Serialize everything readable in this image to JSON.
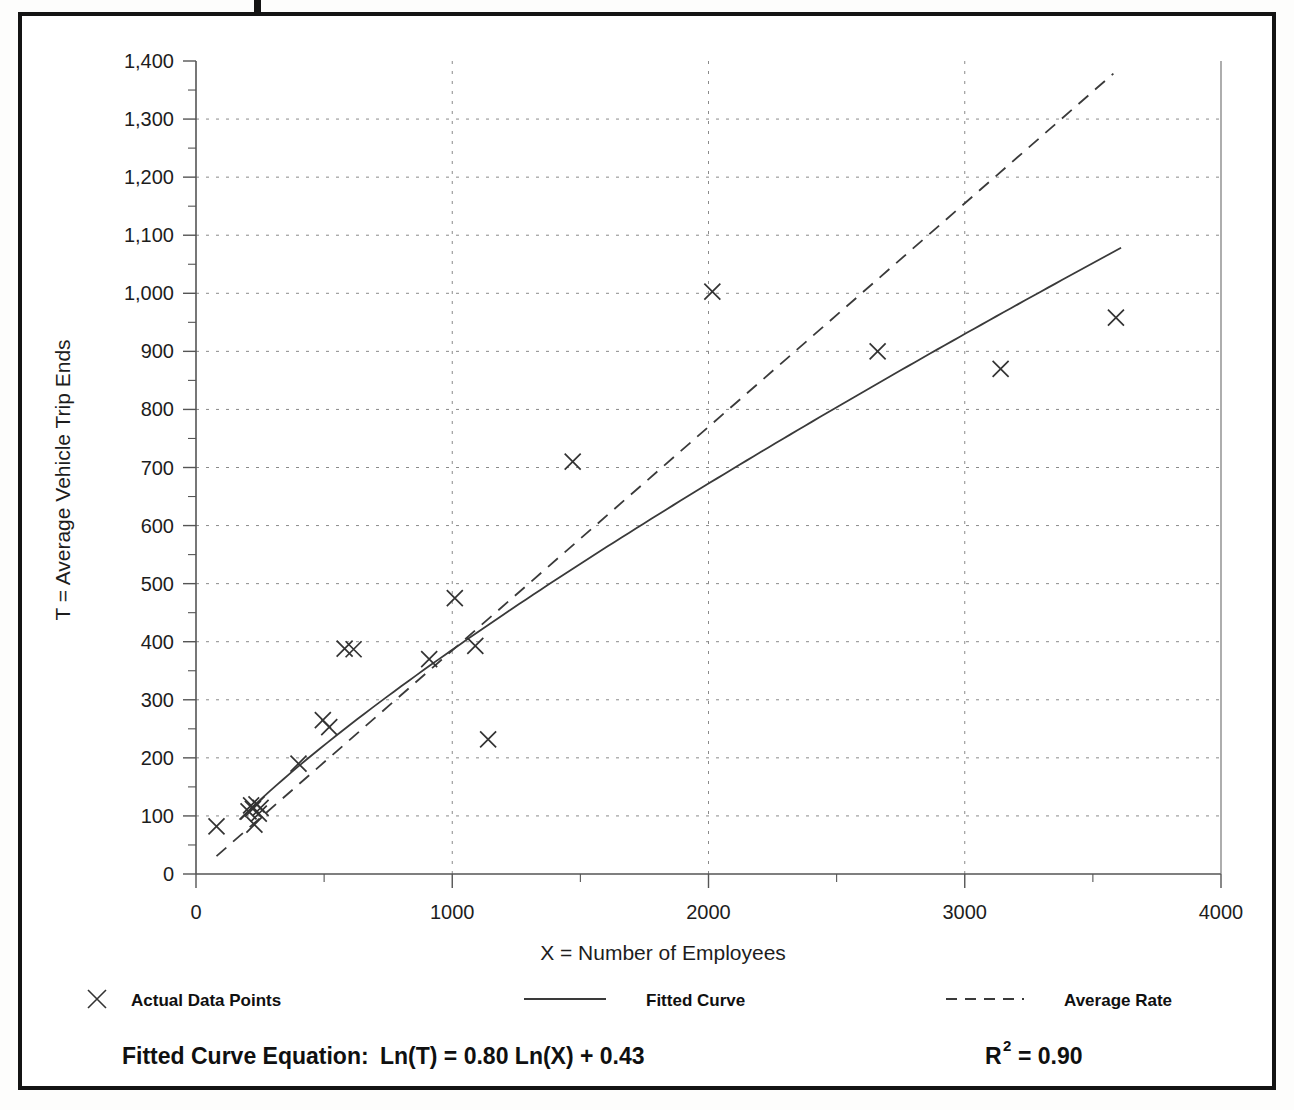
{
  "figure": {
    "frame_color": "#141414",
    "background": "#ffffff"
  },
  "chart_data": {
    "type": "scatter",
    "title": "",
    "xlabel": "X = Number of Employees",
    "ylabel": "T = Average Vehicle Trip Ends",
    "xlim": [
      0,
      4000
    ],
    "ylim": [
      0,
      1400
    ],
    "x_ticks": [
      0,
      1000,
      2000,
      3000,
      4000
    ],
    "x_tick_labels": [
      "0",
      "1000",
      "2000",
      "3000",
      "4000"
    ],
    "x_minor_step": 500,
    "y_ticks": [
      0,
      100,
      200,
      300,
      400,
      500,
      600,
      700,
      800,
      900,
      1000,
      1100,
      1200,
      1300,
      1400
    ],
    "y_tick_labels": [
      "0",
      "100",
      "200",
      "300",
      "400",
      "500",
      "600",
      "700",
      "800",
      "900",
      "1,000",
      "1,100",
      "1,200",
      "1,300",
      "1,400"
    ],
    "y_minor_step": 50,
    "grid": true,
    "grid_style": "dotted",
    "grid_color": "#8a8a8a",
    "legend_position": "below",
    "series": [
      {
        "name": "Actual Data Points",
        "type": "scatter",
        "marker": "x",
        "color": "#333333",
        "points": [
          [
            80,
            82
          ],
          [
            205,
            108
          ],
          [
            215,
            118
          ],
          [
            222,
            112
          ],
          [
            228,
            85
          ],
          [
            236,
            120
          ],
          [
            245,
            104
          ],
          [
            252,
            114
          ],
          [
            400,
            190
          ],
          [
            495,
            265
          ],
          [
            520,
            253
          ],
          [
            580,
            388
          ],
          [
            615,
            387
          ],
          [
            910,
            370
          ],
          [
            1010,
            475
          ],
          [
            1090,
            393
          ],
          [
            1140,
            232
          ],
          [
            1470,
            710
          ],
          [
            2015,
            1003
          ],
          [
            2660,
            900
          ],
          [
            3140,
            870
          ],
          [
            3590,
            958
          ]
        ]
      },
      {
        "name": "Fitted Curve",
        "type": "line",
        "style": "solid",
        "color": "#3a3a3a",
        "equation": "Ln(T) = 0.80 Ln(X) + 0.43",
        "intercept": 0.43,
        "slope": 0.8,
        "x_range": [
          170,
          3610
        ]
      },
      {
        "name": "Average Rate",
        "type": "line",
        "style": "dashed",
        "color": "#3a3a3a",
        "slope_per_employee": 0.385,
        "x_range": [
          80,
          3580
        ]
      }
    ]
  },
  "legend": {
    "items": [
      {
        "label": "Actual Data Points",
        "marker": "x-marker"
      },
      {
        "label": "Fitted Curve",
        "marker": "solid-line"
      },
      {
        "label": "Average Rate",
        "marker": "dashed-line"
      }
    ]
  },
  "footnote": {
    "equation_label": "Fitted Curve Equation:",
    "equation_body": "Ln(T) = 0.80 Ln(X) + 0.43",
    "r_squared_base": "R",
    "r_squared_exp": "2",
    "r_squared_value": "= 0.90"
  }
}
